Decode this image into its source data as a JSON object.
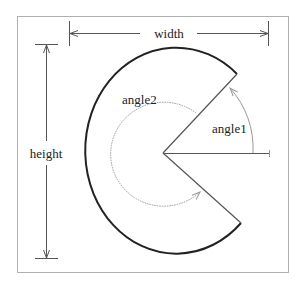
{
  "diagram": {
    "labels": {
      "width": "width",
      "height": "height",
      "angle1": "angle1",
      "angle2": "angle2"
    },
    "colors": {
      "frame": "#b0b0b0",
      "outer_arc": "#222222",
      "radial_lines": "#555555",
      "dimension_lines": "#555555",
      "angle_arcs": "#9a9a9a",
      "text": "#222222",
      "background": "#ffffff"
    },
    "shape": {
      "type": "pieslice",
      "center": [
        163,
        153
      ],
      "start_point": [
        237,
        74
      ],
      "end_point": [
        241,
        223
      ]
    }
  }
}
